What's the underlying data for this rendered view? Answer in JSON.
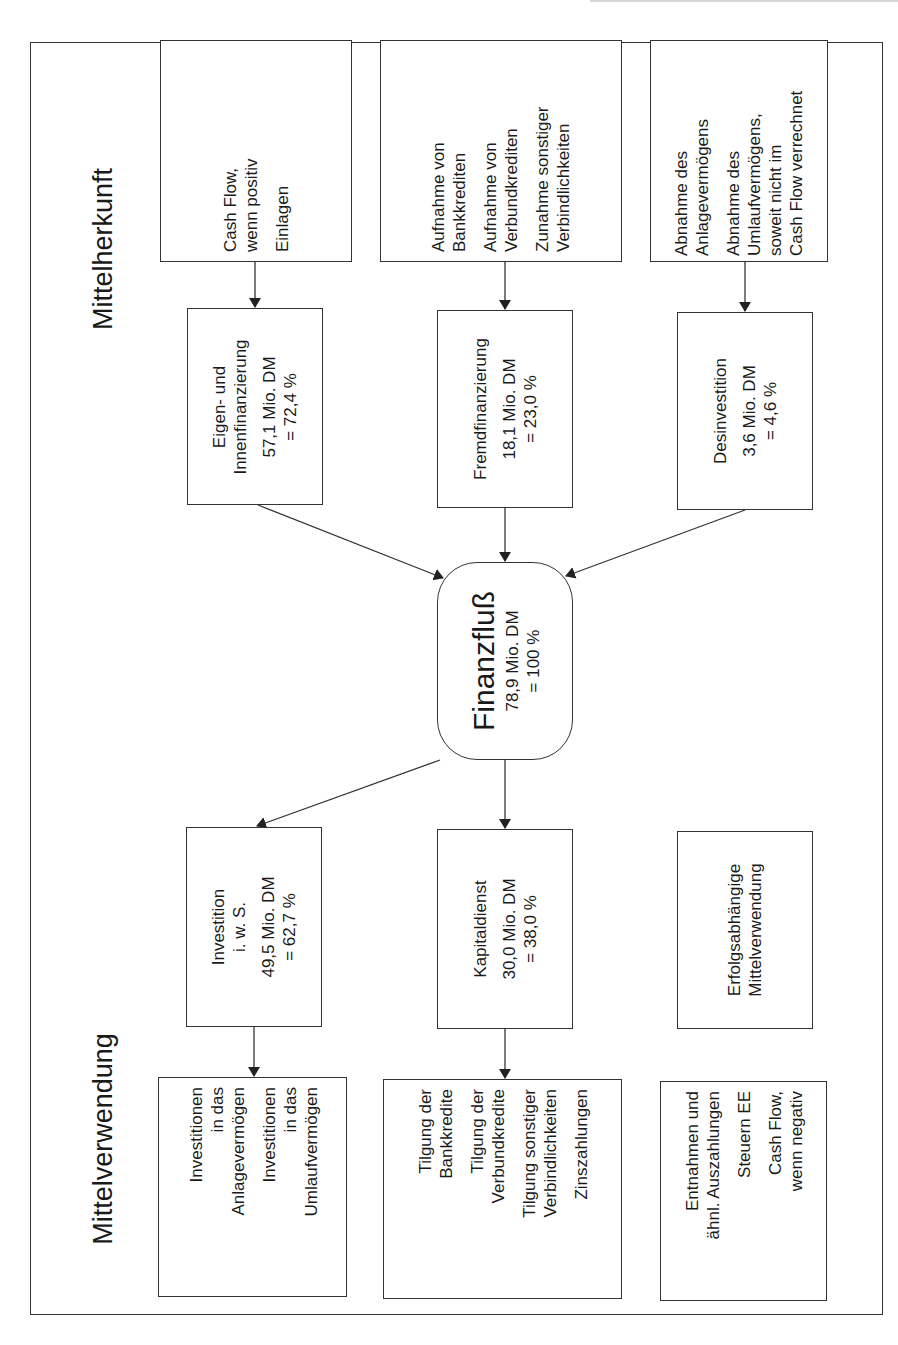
{
  "sections": {
    "source_title": "Mittelherkunft",
    "use_title": "Mittelverwendung"
  },
  "sources": [
    {
      "detail_items": [
        [
          "Cash Flow,",
          "wenn positiv"
        ],
        [
          "Einlagen"
        ]
      ],
      "category": [
        "Eigen- und",
        "Innenfinanzierung"
      ],
      "amount": "57,1 Mio. DM",
      "percent": "= 72,4  %"
    },
    {
      "detail_items": [
        [
          "Aufnahme von",
          "Bankkrediten"
        ],
        [
          "Aufnahme von",
          "Verbundkrediten"
        ],
        [
          "Zunahme sonstiger",
          "Verbindlichkeiten"
        ]
      ],
      "category": [
        "Fremdfinanzierung"
      ],
      "amount": "18,1 Mio. DM",
      "percent": "= 23,0 %"
    },
    {
      "detail_items": [
        [
          "Abnahme des",
          "Anlagevermögens"
        ],
        [
          "Abnahme des",
          "Umlaufvermögens,",
          "soweit nicht im",
          "Cash Flow verrechnet"
        ]
      ],
      "category": [
        "Desinvestition"
      ],
      "amount": "3,6 Mio. DM",
      "percent": "= 4,6 %"
    }
  ],
  "center": {
    "title": "Finanzfluß",
    "amount": "78,9 Mio. DM",
    "percent": "= 100 %"
  },
  "uses": [
    {
      "category": [
        "Investition",
        "i. w. S."
      ],
      "amount": "49,5 Mio. DM",
      "percent": "= 62,7  %",
      "detail_items": [
        [
          "Investitionen",
          "in das",
          "Anlagevermögen"
        ],
        [
          "Investitionen",
          "in das",
          "Umlaufvermögen"
        ]
      ]
    },
    {
      "category": [
        "Kapitaldienst"
      ],
      "amount": "30,0 Mio. DM",
      "percent": "= 38,0 %",
      "detail_items": [
        [
          "Tilgung der",
          "Bankkredite"
        ],
        [
          "Tilgung der",
          "Verbundkredite"
        ],
        [
          "Tilgung sonstiger",
          "Verbindlichkeiten"
        ],
        [
          "Zinszahlungen"
        ]
      ]
    },
    {
      "category": [
        "Erfolgsabhängige",
        "Mittelverwendung"
      ],
      "amount": "",
      "percent": "",
      "detail_items": [
        [
          "Entnahmen und",
          "ähnl. Auszahlungen"
        ],
        [
          "Steuern EE"
        ],
        [
          "Cash Flow,",
          "wenn negativ"
        ]
      ]
    }
  ],
  "colors": {
    "line": "#333333",
    "background": "#ffffff",
    "text": "#1a1a1a"
  }
}
